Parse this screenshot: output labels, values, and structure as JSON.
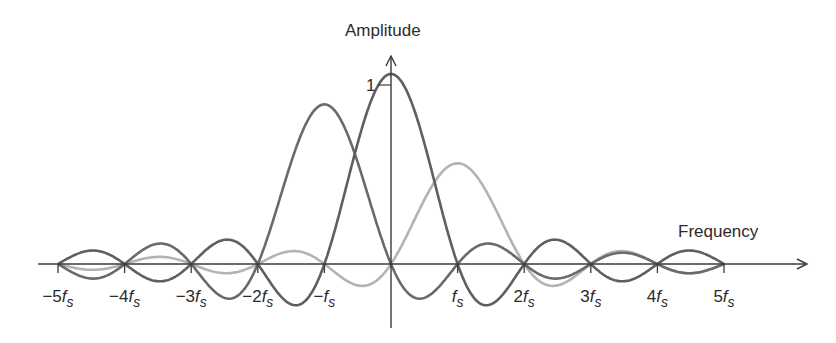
{
  "chart_data": {
    "type": "line",
    "title": "",
    "xlabel": "Frequency",
    "ylabel": "Amplitude",
    "y_tick_label": "1",
    "x_ticks": [
      {
        "value": -5,
        "label": "−5f",
        "sub": "s"
      },
      {
        "value": -4,
        "label": "−4f",
        "sub": "s"
      },
      {
        "value": -3,
        "label": "−3f",
        "sub": "s"
      },
      {
        "value": -2,
        "label": "−2f",
        "sub": "s"
      },
      {
        "value": -1,
        "label": "−f",
        "sub": "s"
      },
      {
        "value": 1,
        "label": "f",
        "sub": "s"
      },
      {
        "value": 2,
        "label": "2f",
        "sub": "s"
      },
      {
        "value": 3,
        "label": "3f",
        "sub": "s"
      },
      {
        "value": 4,
        "label": "4f",
        "sub": "s"
      },
      {
        "value": 5,
        "label": "5f",
        "sub": "s"
      }
    ],
    "x_range": [
      -5,
      5
    ],
    "y_range": [
      -0.25,
      1
    ],
    "grid": false,
    "legend": null,
    "series": [
      {
        "name": "sinc centered at 0",
        "center": 0,
        "amplitude": 1.0,
        "color": "#5f5f5f"
      },
      {
        "name": "sinc centered at -fs",
        "center": -1,
        "amplitude": 0.84,
        "color": "#6a6a6a"
      },
      {
        "name": "sinc centered at +fs",
        "center": 1,
        "amplitude": 0.53,
        "color": "#b3b3b3"
      }
    ]
  },
  "axes": {
    "x_label": "Frequency",
    "y_label": "Amplitude",
    "y_unit_tick": "1",
    "axis_color": "#3a3a3a"
  }
}
